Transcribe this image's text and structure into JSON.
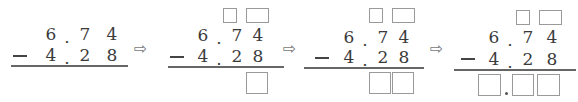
{
  "problem": {
    "minuend": [
      "6",
      ".",
      "7",
      "4"
    ],
    "subtrahend": [
      "4",
      ".",
      "2",
      "8"
    ],
    "operator": "−",
    "arrow": "⇨"
  },
  "steps": [
    {
      "name": "step-1",
      "borrow_boxes": 0,
      "answer_boxes": 0,
      "answer_has_point": false
    },
    {
      "name": "step-2",
      "borrow_boxes": 2,
      "answer_boxes": 1,
      "answer_has_point": false
    },
    {
      "name": "step-3",
      "borrow_boxes": 2,
      "answer_boxes": 2,
      "answer_has_point": false
    },
    {
      "name": "step-4",
      "borrow_boxes": 2,
      "answer_boxes": 3,
      "answer_has_point": true
    }
  ]
}
